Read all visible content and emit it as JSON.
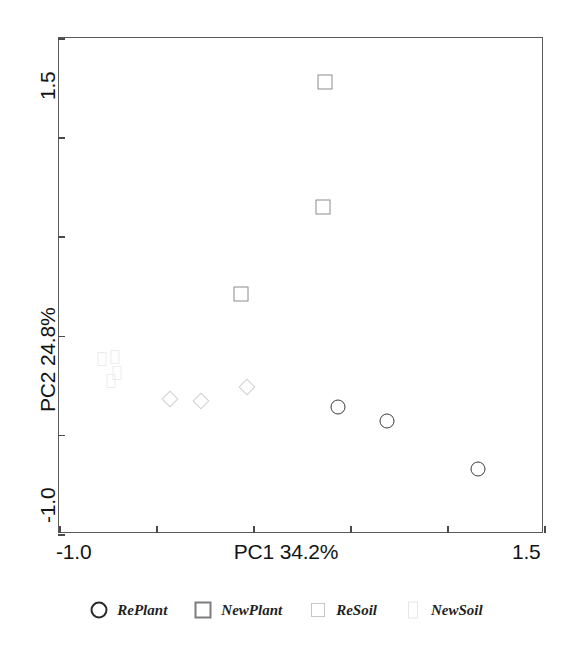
{
  "chart_data": {
    "type": "scatter",
    "title": "",
    "xlabel": "PC1 34.2%",
    "ylabel": "PC2 24.8%",
    "xlim": [
      -1.0,
      1.5
    ],
    "ylim": [
      -1.0,
      1.5
    ],
    "xticks": [
      -1.0,
      -0.5,
      0.0,
      0.5,
      1.0,
      1.5
    ],
    "yticks": [
      -1.0,
      -0.5,
      0.0,
      0.5,
      1.0,
      1.5
    ],
    "xtick_labels": [
      "-1.0",
      "",
      "",
      "",
      "",
      "1.5"
    ],
    "ytick_labels": [
      "-1.0",
      "",
      "",
      "",
      "",
      "1.5"
    ],
    "grid": false,
    "legend_position": "below",
    "series": [
      {
        "name": "RePlant",
        "marker": "circle",
        "color": "#3c3c3c",
        "points": [
          {
            "x": 0.44,
            "y": -0.36
          },
          {
            "x": 0.69,
            "y": -0.43
          },
          {
            "x": 1.16,
            "y": -0.67
          }
        ]
      },
      {
        "name": "NewPlant",
        "marker": "square",
        "color": "#8c8c8c",
        "points": [
          {
            "x": 0.37,
            "y": 1.28
          },
          {
            "x": 0.36,
            "y": 0.65
          },
          {
            "x": -0.06,
            "y": 0.21
          }
        ]
      },
      {
        "name": "ReSoil",
        "marker": "diamond",
        "color": "#cfcfcf",
        "points": [
          {
            "x": -0.43,
            "y": -0.32
          },
          {
            "x": -0.27,
            "y": -0.33
          },
          {
            "x": -0.03,
            "y": -0.26
          }
        ]
      },
      {
        "name": "NewSoil",
        "marker": "tall-square",
        "color": "#ececec",
        "points": [
          {
            "x": -0.78,
            "y": -0.12
          },
          {
            "x": -0.71,
            "y": -0.11
          },
          {
            "x": -0.7,
            "y": -0.19
          },
          {
            "x": -0.73,
            "y": -0.23
          }
        ]
      }
    ]
  },
  "axes": {
    "x_tick_min_label": "-1.0",
    "x_tick_max_label": "1.5",
    "x_title": "PC1 34.2%",
    "y_tick_min_label": "-1.0",
    "y_tick_max_label": "1.5",
    "y_title": "PC2 24.8%"
  },
  "legend": {
    "entries": [
      {
        "label": "RePlant",
        "marker": "circle"
      },
      {
        "label": "NewPlant",
        "marker": "square"
      },
      {
        "label": "ReSoil",
        "marker": "diamond"
      },
      {
        "label": "NewSoil",
        "marker": "tall-square"
      }
    ]
  }
}
